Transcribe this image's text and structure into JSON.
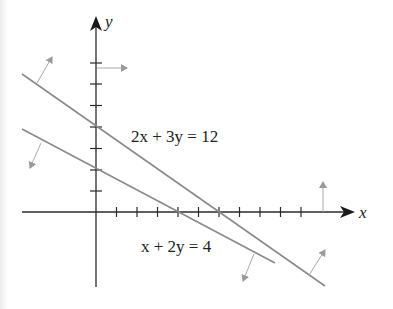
{
  "figure": {
    "axes": {
      "x_label": "x",
      "y_label": "y",
      "x_ticks": [
        1,
        2,
        3,
        4,
        5,
        6,
        7,
        8,
        9,
        10
      ],
      "y_ticks": [
        1,
        2,
        3,
        4,
        5,
        6,
        7
      ]
    },
    "lines": [
      {
        "equation": "2x + 3y = 12",
        "x_intercept": 6,
        "y_intercept": 4,
        "color": "#8a8a8a"
      },
      {
        "equation": "x + 2y = 4",
        "x_intercept": 4,
        "y_intercept": 2,
        "color": "#8a8a8a"
      }
    ],
    "direction_arrows": [
      {
        "attached_to": "2x + 3y = 12",
        "position": "upper-left",
        "direction": "up-right (normal)"
      },
      {
        "attached_to": "2x + 3y = 12",
        "position": "lower-right",
        "direction": "up-right (normal)"
      },
      {
        "attached_to": "x + 2y = 4",
        "position": "left",
        "direction": "down-left"
      },
      {
        "attached_to": "x + 2y = 4",
        "position": "right",
        "direction": "down-left"
      },
      {
        "attached_to": "y-axis",
        "position": "top",
        "direction": "right"
      },
      {
        "attached_to": "x-axis",
        "position": "right",
        "direction": "up"
      }
    ],
    "labels": {
      "eq1": "2x + 3y = 12",
      "eq2": "x + 2y = 4"
    }
  }
}
